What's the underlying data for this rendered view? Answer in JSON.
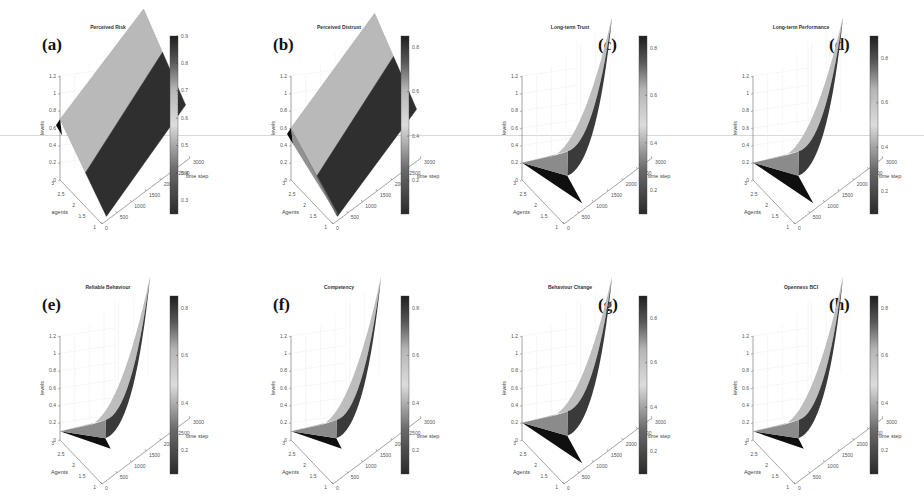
{
  "figure": {
    "layout": "4 columns x 2 rows of 3D surface plots",
    "colormap": "grayscale-jet (dark-light-dark)"
  },
  "chart_data": [
    {
      "type": "surface3d",
      "panel_label": "(a)",
      "title": "Perceived Risk",
      "xlabel": "time step",
      "ylabel": "agents",
      "zlabel": "levels",
      "x_ticks": [
        "0",
        "500",
        "1000",
        "1500",
        "2000",
        "2500",
        "3000"
      ],
      "y_ticks": [
        "1",
        "1.5",
        "2",
        "2.5",
        "3"
      ],
      "z_ticks": [
        "0",
        "0.2",
        "0.4",
        "0.6",
        "0.8",
        "1",
        "1.2"
      ],
      "zlim": [
        0,
        1.2
      ],
      "colorbar_ticks": [
        "0.3",
        "0.4",
        "0.5",
        "0.6",
        "0.7",
        "0.8",
        "0.9"
      ],
      "colorbar_range": [
        0.25,
        0.9
      ],
      "label_position": "top-left",
      "shape": "slab",
      "surface": {
        "start_level": 0.7,
        "end_level": 0.9,
        "split_level": 0.55
      }
    },
    {
      "type": "surface3d",
      "panel_label": "(b)",
      "title": "Perceived Distrust",
      "xlabel": "time step",
      "ylabel": "Agents",
      "zlabel": "levels",
      "x_ticks": [
        "0",
        "500",
        "1000",
        "1500",
        "2000",
        "2500",
        "3000"
      ],
      "y_ticks": [
        "1",
        "1.5",
        "2",
        "2.5",
        "3"
      ],
      "z_ticks": [
        "0",
        "0.2",
        "0.4",
        "0.6",
        "0.8",
        "1",
        "1.2"
      ],
      "zlim": [
        0,
        1.2
      ],
      "colorbar_ticks": [
        "0.2",
        "0.4",
        "0.6",
        "0.8"
      ],
      "colorbar_range": [
        0.05,
        0.85
      ],
      "label_position": "top-left",
      "shape": "slab",
      "surface": {
        "start_level": 0.6,
        "end_level": 0.85,
        "split_level": 0.45
      }
    },
    {
      "type": "surface3d",
      "panel_label": "(c)",
      "title": "Long-term Trust",
      "xlabel": "time step",
      "ylabel": "Agents",
      "zlabel": "levels",
      "x_ticks": [
        "0",
        "500",
        "1000",
        "1500",
        "2000",
        "2500",
        "3000"
      ],
      "y_ticks": [
        "1",
        "1.5",
        "2",
        "2.5",
        "3"
      ],
      "z_ticks": [
        "0",
        "0.2",
        "0.4",
        "0.6",
        "0.8",
        "1",
        "1.2"
      ],
      "zlim": [
        0,
        1.2
      ],
      "colorbar_ticks": [
        "0.2",
        "0.4",
        "0.6",
        "0.8"
      ],
      "colorbar_range": [
        0.1,
        0.85
      ],
      "label_position": "top-right",
      "shape": "wing",
      "surface": {
        "start_level": 0.2,
        "end_level": 0.6
      }
    },
    {
      "type": "surface3d",
      "panel_label": "(d)",
      "title": "Long-term Performance",
      "xlabel": "time step",
      "ylabel": "Agents",
      "zlabel": "levels",
      "x_ticks": [
        "0",
        "500",
        "1000",
        "1500",
        "2000",
        "2500",
        "3000"
      ],
      "y_ticks": [
        "1",
        "1.5",
        "2",
        "2.5",
        "3"
      ],
      "z_ticks": [
        "0",
        "0.2",
        "0.4",
        "0.6",
        "0.8",
        "1",
        "1.2"
      ],
      "zlim": [
        0,
        1.2
      ],
      "colorbar_ticks": [
        "0.2",
        "0.4",
        "0.6",
        "0.8"
      ],
      "colorbar_range": [
        0.1,
        0.9
      ],
      "label_position": "top-right",
      "shape": "wing",
      "surface": {
        "start_level": 0.2,
        "end_level": 0.6
      }
    },
    {
      "type": "surface3d",
      "panel_label": "(e)",
      "title": "Reliable Behaviour",
      "xlabel": "time step",
      "ylabel": "Agents",
      "zlabel": "levels",
      "x_ticks": [
        "0",
        "500",
        "1000",
        "1500",
        "2000",
        "2500",
        "3000"
      ],
      "y_ticks": [
        "1",
        "1.5",
        "2",
        "2.5",
        "3"
      ],
      "z_ticks": [
        "0",
        "0.2",
        "0.4",
        "0.6",
        "0.8",
        "1",
        "1.2"
      ],
      "zlim": [
        0,
        1.2
      ],
      "colorbar_ticks": [
        "0.2",
        "0.4",
        "0.6",
        "0.8"
      ],
      "colorbar_range": [
        0.1,
        0.85
      ],
      "label_position": "top-left",
      "shape": "wing-flat",
      "surface": {
        "start_level": 0.1,
        "end_level": 0.6
      }
    },
    {
      "type": "surface3d",
      "panel_label": "(f)",
      "title": "Competency",
      "xlabel": "time step",
      "ylabel": "Agents",
      "zlabel": "levels",
      "x_ticks": [
        "0",
        "500",
        "1000",
        "1500",
        "2000",
        "2500",
        "3000"
      ],
      "y_ticks": [
        "1",
        "1.5",
        "2",
        "2.5",
        "3"
      ],
      "z_ticks": [
        "0",
        "0.2",
        "0.4",
        "0.6",
        "0.8",
        "1",
        "1.2"
      ],
      "zlim": [
        0,
        1.2
      ],
      "colorbar_ticks": [
        "0.2",
        "0.4",
        "0.6",
        "0.8"
      ],
      "colorbar_range": [
        0.1,
        0.85
      ],
      "label_position": "top-left",
      "shape": "wing-flat",
      "surface": {
        "start_level": 0.1,
        "end_level": 0.6
      }
    },
    {
      "type": "surface3d",
      "panel_label": "(g)",
      "title": "Behaviour Change",
      "xlabel": "time step",
      "ylabel": "Agents",
      "zlabel": "levels",
      "x_ticks": [
        "0",
        "500",
        "1000",
        "1500",
        "2000",
        "2500",
        "3000"
      ],
      "y_ticks": [
        "1",
        "1.5",
        "2",
        "2.5",
        "3"
      ],
      "z_ticks": [
        "0",
        "0.2",
        "0.4",
        "0.6",
        "0.8",
        "1",
        "1.2"
      ],
      "zlim": [
        0,
        1.2
      ],
      "colorbar_ticks": [
        "0.2",
        "0.4",
        "0.6",
        "0.8"
      ],
      "colorbar_range": [
        0.1,
        0.9
      ],
      "label_position": "top-right",
      "shape": "wing",
      "surface": {
        "start_level": 0.2,
        "end_level": 0.6
      }
    },
    {
      "type": "surface3d",
      "panel_label": "(h)",
      "title": "Openness BCI",
      "xlabel": "time step",
      "ylabel": "Agents",
      "zlabel": "levels",
      "x_ticks": [
        "0",
        "500",
        "1000",
        "1500",
        "2000",
        "2500",
        "3000"
      ],
      "y_ticks": [
        "1",
        "1.5",
        "2",
        "2.5",
        "3"
      ],
      "z_ticks": [
        "0",
        "0.2",
        "0.4",
        "0.6",
        "0.8",
        "1",
        "1.2"
      ],
      "zlim": [
        0,
        1.2
      ],
      "colorbar_ticks": [
        "0.2",
        "0.4",
        "0.6",
        "0.8"
      ],
      "colorbar_range": [
        0.1,
        0.85
      ],
      "label_position": "top-right",
      "shape": "wing-flat",
      "surface": {
        "start_level": 0.1,
        "end_level": 0.6
      }
    }
  ]
}
